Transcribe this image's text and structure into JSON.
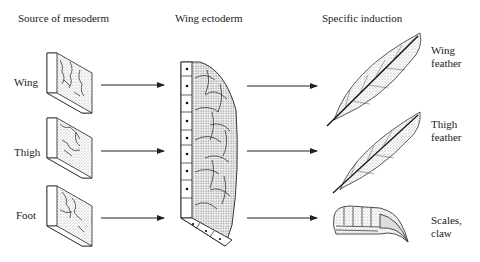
{
  "headers": {
    "source": "Source of mesoderm",
    "ectoderm": "Wing ectoderm",
    "induction": "Specific induction"
  },
  "rows": [
    {
      "source_label": "Wing",
      "result_line1": "Wing",
      "result_line2": "feather",
      "result_icon": "wing-feather"
    },
    {
      "source_label": "Thigh",
      "result_line1": "Thigh",
      "result_line2": "feather",
      "result_icon": "thigh-feather"
    },
    {
      "source_label": "Foot",
      "result_line1": "Scales,",
      "result_line2": "claw",
      "result_icon": "scales-claw"
    }
  ]
}
